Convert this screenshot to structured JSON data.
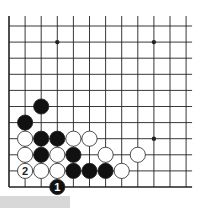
{
  "diagram": {
    "type": "go-board-corner",
    "colors": {
      "line": "#222222",
      "black": "#111111",
      "white": "#ffffff",
      "label_on_black": "#ffffff",
      "label_on_white": "#222222"
    },
    "grid": {
      "cols": 12,
      "rows": 11,
      "open_top": true,
      "open_right": true,
      "bottom_edge": true,
      "left_edge": true
    },
    "star_points": [
      {
        "col": 3,
        "row": 1
      },
      {
        "col": 9,
        "row": 1
      },
      {
        "col": 9,
        "row": 7
      }
    ],
    "stones": [
      {
        "color": "black",
        "col": 2,
        "row": 5
      },
      {
        "color": "black",
        "col": 1,
        "row": 6
      },
      {
        "color": "white",
        "col": 1,
        "row": 7
      },
      {
        "color": "black",
        "col": 2,
        "row": 7
      },
      {
        "color": "black",
        "col": 3,
        "row": 7
      },
      {
        "color": "white",
        "col": 4,
        "row": 7
      },
      {
        "color": "white",
        "col": 5,
        "row": 7
      },
      {
        "color": "white",
        "col": 1,
        "row": 8
      },
      {
        "color": "black",
        "col": 2,
        "row": 8
      },
      {
        "color": "white",
        "col": 3,
        "row": 8
      },
      {
        "color": "black",
        "col": 4,
        "row": 8
      },
      {
        "color": "white",
        "col": 6,
        "row": 8
      },
      {
        "color": "white",
        "col": 8,
        "row": 8
      },
      {
        "color": "white",
        "col": 1,
        "row": 9,
        "label": "2"
      },
      {
        "color": "white",
        "col": 2,
        "row": 9
      },
      {
        "color": "white",
        "col": 3,
        "row": 9
      },
      {
        "color": "black",
        "col": 4,
        "row": 9
      },
      {
        "color": "black",
        "col": 5,
        "row": 9
      },
      {
        "color": "black",
        "col": 6,
        "row": 9
      },
      {
        "color": "white",
        "col": 7,
        "row": 9
      },
      {
        "color": "black",
        "col": 3,
        "row": 10,
        "label": "1"
      }
    ]
  }
}
